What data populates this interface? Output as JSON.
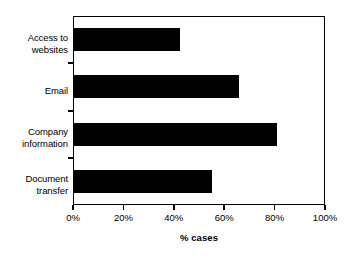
{
  "chart_data": {
    "type": "bar",
    "orientation": "horizontal",
    "title": "",
    "xlabel": "% cases",
    "ylabel": "",
    "categories": [
      "Access to websites",
      "Email",
      "Company information",
      "Document transfer"
    ],
    "values": [
      42.5,
      66,
      81,
      55
    ],
    "xlim": [
      0,
      100
    ],
    "xticks": [
      0,
      20,
      40,
      60,
      80,
      100
    ],
    "xtick_labels": [
      "0%",
      "20%",
      "40%",
      "60%",
      "80%",
      "100%"
    ],
    "grid": false,
    "legend": false,
    "bar_color": "#000000",
    "background_color": "#ffffff",
    "axis_color": "#000000"
  }
}
